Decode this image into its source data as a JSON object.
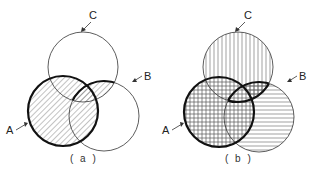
{
  "figure": {
    "panels": [
      {
        "id": "a",
        "caption": "( a )",
        "labels": {
          "A": "A",
          "B": "B",
          "C": "C"
        },
        "circles": {
          "A": {
            "cx": 63,
            "cy": 111,
            "r": 35
          },
          "B": {
            "cx": 104,
            "cy": 116,
            "r": 35
          },
          "C": {
            "cx": 83,
            "cy": 67,
            "r": 35
          }
        },
        "shading": "diagonal hatch on A ∪ (B ∩ C)",
        "bold_outline": "A ∪ (B ∩ C)"
      },
      {
        "id": "b",
        "caption": "( b )",
        "labels": {
          "A": "A",
          "B": "B",
          "C": "C"
        },
        "circles": {
          "A": {
            "cx": 219,
            "cy": 112,
            "r": 35
          },
          "B": {
            "cx": 259,
            "cy": 117,
            "r": 35
          },
          "C": {
            "cx": 238,
            "cy": 67,
            "r": 35
          }
        },
        "shading": "C vertical lines, B horizontal lines, A cross-hatch (grid)",
        "bold_outline": "A ∪ (B ∩ C)"
      }
    ],
    "colors": {
      "stroke": "#222222",
      "hatch": "#555555",
      "background": "#ffffff"
    }
  }
}
